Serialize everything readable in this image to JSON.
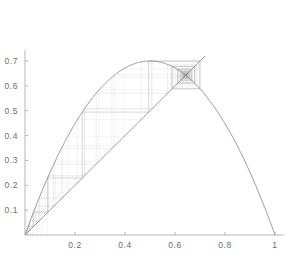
{
  "figure": {
    "title": "",
    "background_color": "#ffffff",
    "axis_color": "#9a9a9a",
    "curve_color": "#7c7c7c",
    "cobweb_color": "#b8b8b8",
    "tick_label_color": "#6d6d6d"
  },
  "chart_data": {
    "type": "line",
    "title": "",
    "subtitle": "",
    "xlabel": "",
    "ylabel": "",
    "xlim": [
      0,
      1.06
    ],
    "ylim": [
      0,
      0.78
    ],
    "grid": false,
    "legend": "none",
    "x_ticks": [
      0.2,
      0.4,
      0.6,
      0.8,
      1
    ],
    "x_tick_labels": [
      "0.2",
      "0.4",
      "0.6",
      "0.8",
      "1"
    ],
    "y_ticks": [
      0.1,
      0.2,
      0.3,
      0.4,
      0.5,
      0.6,
      0.7
    ],
    "y_tick_labels": [
      "0.1",
      "0.2",
      "0.3",
      "0.4",
      "0.5",
      "0.6",
      "0.7"
    ],
    "series": [
      {
        "name": "logistic-map-parabola",
        "type": "line",
        "equation": "y = r*x*(1-x)",
        "r": 2.8,
        "x_start": 0.0,
        "x_end": 1.0,
        "peak": {
          "x": 0.5,
          "y": 0.7
        },
        "color": "#7c7c7c"
      },
      {
        "name": "identity-diagonal",
        "type": "line",
        "equation": "y = x",
        "x_start": 0.0,
        "x_end": 0.72,
        "color": "#7c7c7c"
      },
      {
        "name": "cobweb-staircase",
        "type": "line",
        "equation": "x_{n+1} = r*x_n*(1-x_n)",
        "r": 2.8,
        "x0": 0.012,
        "iterations": 140,
        "fixed_point": {
          "x": 0.643,
          "y": 0.643
        },
        "color": "#b8b8b8"
      }
    ]
  }
}
